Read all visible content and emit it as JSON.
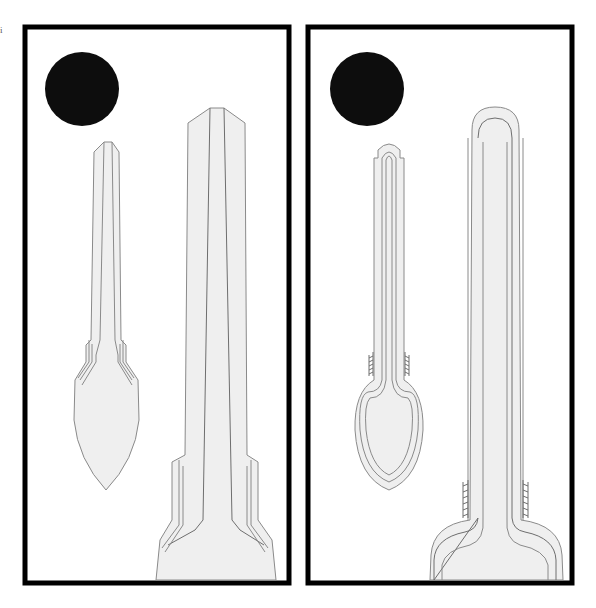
{
  "figure": {
    "corner_mark": "i",
    "panels": [
      {
        "id": "left",
        "frame": {
          "x": 23,
          "y": 25,
          "w": 267,
          "h": 560
        },
        "disc": {
          "cx": 82,
          "cy": 89,
          "r": 37
        },
        "objects": [
          "small-spoon-angular",
          "large-tube-angular"
        ]
      },
      {
        "id": "right",
        "frame": {
          "x": 306,
          "y": 25,
          "w": 267,
          "h": 560
        },
        "disc": {
          "cx": 367,
          "cy": 89,
          "r": 37
        },
        "objects": [
          "small-spoon-rounded",
          "large-tube-rounded"
        ]
      }
    ],
    "colors": {
      "frame": "#000000",
      "disc": "#0d0d0d",
      "fill": "#efefef",
      "stroke": "#8a8a8a",
      "stroke_dark": "#6e6e6e"
    }
  }
}
